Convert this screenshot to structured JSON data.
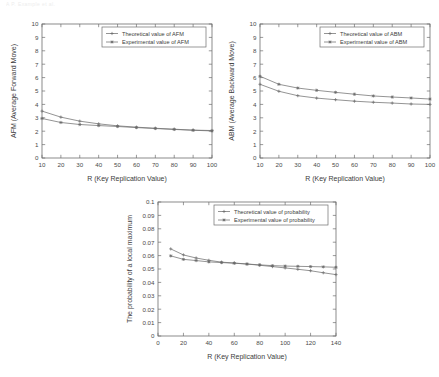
{
  "page": {
    "header_text": "A   P. Example et al."
  },
  "charts": [
    {
      "id": "chart-afm",
      "name": "afm-chart",
      "chart_data": {
        "type": "line",
        "title": "",
        "xlabel": "R (Key Replication Value)",
        "ylabel": "AFM (Average Forward Move)",
        "xlim": [
          10,
          100
        ],
        "ylim": [
          0,
          10
        ],
        "xticks": [
          10,
          20,
          30,
          40,
          50,
          60,
          70,
          80,
          90,
          100
        ],
        "yticks": [
          0,
          1,
          2,
          3,
          4,
          5,
          6,
          7,
          8,
          9,
          10
        ],
        "grid": false,
        "legend_position": "top-right",
        "x": [
          10,
          20,
          30,
          40,
          50,
          60,
          70,
          80,
          90,
          100
        ],
        "series": [
          {
            "name": "Theoretical value of AFM",
            "values": [
              3.5,
              3.05,
              2.75,
              2.55,
              2.4,
              2.3,
              2.22,
              2.15,
              2.08,
              2.05
            ]
          },
          {
            "name": "Experimental value of AFM",
            "values": [
              2.95,
              2.65,
              2.5,
              2.42,
              2.35,
              2.27,
              2.2,
              2.13,
              2.07,
              2.02
            ]
          }
        ]
      }
    },
    {
      "id": "chart-abm",
      "name": "abm-chart",
      "chart_data": {
        "type": "line",
        "title": "",
        "xlabel": "R (Key Replication Value)",
        "ylabel": "ABM (Average Backward Move)",
        "xlim": [
          10,
          100
        ],
        "ylim": [
          0,
          10
        ],
        "xticks": [
          10,
          20,
          30,
          40,
          50,
          60,
          70,
          80,
          90,
          100
        ],
        "yticks": [
          0,
          1,
          2,
          3,
          4,
          5,
          6,
          7,
          8,
          9,
          10
        ],
        "grid": false,
        "legend_position": "top-right",
        "x": [
          10,
          20,
          30,
          40,
          50,
          60,
          70,
          80,
          90,
          100
        ],
        "series": [
          {
            "name": "Theoretical value of ABM",
            "values": [
              5.5,
              4.98,
              4.65,
              4.47,
              4.35,
              4.24,
              4.16,
              4.1,
              4.03,
              4.0
            ]
          },
          {
            "name": "Experimental value of ABM",
            "values": [
              6.1,
              5.5,
              5.22,
              5.05,
              4.9,
              4.76,
              4.63,
              4.55,
              4.48,
              4.4
            ]
          }
        ]
      }
    },
    {
      "id": "chart-prob",
      "name": "probability-chart",
      "chart_data": {
        "type": "line",
        "title": "",
        "xlabel": "R (Key Replication Value)",
        "ylabel": "The probability of a local maximum",
        "xlim": [
          0,
          140
        ],
        "ylim": [
          0,
          0.1
        ],
        "xticks": [
          0,
          20,
          40,
          60,
          80,
          100,
          120,
          140
        ],
        "yticks": [
          0,
          0.01,
          0.02,
          0.03,
          0.04,
          0.05,
          0.06,
          0.07,
          0.08,
          0.09,
          0.1
        ],
        "ytick_labels": [
          "0",
          "0.01",
          "0.02",
          "0.03",
          "0.04",
          "0.05",
          "0.06",
          "0.07",
          "0.08",
          "0.09",
          "0.1"
        ],
        "grid": false,
        "legend_position": "top-right",
        "x": [
          10,
          20,
          30,
          40,
          50,
          60,
          70,
          80,
          90,
          100,
          110,
          120,
          130,
          140
        ],
        "series": [
          {
            "name": "Theoretical value of probability",
            "values": [
              0.065,
              0.0605,
              0.0582,
              0.0565,
              0.0551,
              0.0545,
              0.0537,
              0.0528,
              0.0518,
              0.0508,
              0.0498,
              0.0487,
              0.0472,
              0.0458
            ]
          },
          {
            "name": "Experimental value of probability",
            "values": [
              0.0598,
              0.0572,
              0.0563,
              0.0553,
              0.0548,
              0.0543,
              0.0537,
              0.0531,
              0.0525,
              0.0522,
              0.052,
              0.0518,
              0.0516,
              0.0513
            ]
          }
        ]
      }
    }
  ]
}
